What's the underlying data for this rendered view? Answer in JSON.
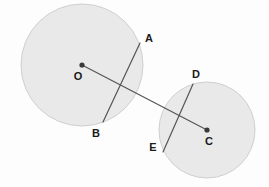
{
  "figure": {
    "background_color": "#fdfdfd",
    "fill_color": "#e9e9e9",
    "stroke_color": "#cfcfcf",
    "line_color": "#555555",
    "label_color": "#1a1a1a",
    "width": 269,
    "height": 187
  },
  "circles": [
    {
      "name": "large-circle",
      "center_label": "O",
      "cx": 82,
      "cy": 65,
      "r": 61
    },
    {
      "name": "small-circle",
      "center_label": "C",
      "cx": 207,
      "cy": 130,
      "r": 48
    }
  ],
  "centers": [
    {
      "label": "O",
      "x": 82,
      "y": 65,
      "label_x": 78,
      "label_y": 77
    },
    {
      "label": "C",
      "x": 207,
      "y": 130,
      "label_x": 209,
      "label_y": 142
    }
  ],
  "segments": [
    {
      "name": "chord-AB",
      "from_label": "A",
      "to_label": "B",
      "x1": 140,
      "y1": 43,
      "x2": 103,
      "y2": 122
    },
    {
      "name": "chord-DE",
      "from_label": "D",
      "to_label": "E",
      "x1": 193,
      "y1": 84,
      "x2": 163,
      "y2": 152
    },
    {
      "name": "segment-OC",
      "from_label": "O",
      "to_label": "C",
      "x1": 82,
      "y1": 65,
      "x2": 207,
      "y2": 130
    }
  ],
  "labels": [
    {
      "text": "A",
      "x": 149,
      "y": 39
    },
    {
      "text": "B",
      "x": 96,
      "y": 134
    },
    {
      "text": "D",
      "x": 196,
      "y": 75
    },
    {
      "text": "E",
      "x": 153,
      "y": 148
    },
    {
      "text": "O",
      "x": 78,
      "y": 77
    },
    {
      "text": "C",
      "x": 209,
      "y": 142
    }
  ]
}
